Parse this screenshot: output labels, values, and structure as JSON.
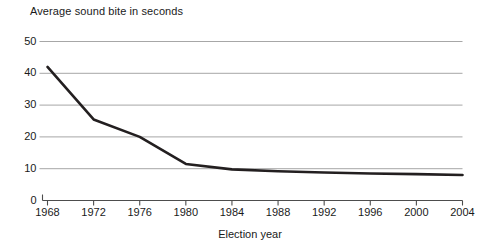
{
  "chart_data": {
    "type": "line",
    "title": "Average sound bite in seconds",
    "xlabel": "Election year",
    "ylabel": "",
    "x": [
      1968,
      1972,
      1976,
      1980,
      1984,
      1988,
      1992,
      1996,
      2000,
      2004
    ],
    "values": [
      42.0,
      25.5,
      20.0,
      11.5,
      9.8,
      9.2,
      8.8,
      8.5,
      8.3,
      8.0
    ],
    "series": [
      {
        "name": "Average sound bite in seconds",
        "values": [
          42.0,
          25.5,
          20.0,
          11.5,
          9.8,
          9.2,
          8.8,
          8.5,
          8.3,
          8.0
        ]
      }
    ],
    "xlim": [
      1968,
      2004
    ],
    "ylim": [
      0,
      50
    ],
    "y_ticks": [
      0,
      10,
      20,
      30,
      40,
      50
    ],
    "x_ticks": [
      1968,
      1972,
      1976,
      1980,
      1984,
      1988,
      1992,
      1996,
      2000,
      2004
    ],
    "y_tick_labels": [
      "0",
      "10",
      "20",
      "30",
      "40",
      "50"
    ],
    "x_tick_labels": [
      "1968",
      "1972",
      "1976",
      "1980",
      "1984",
      "1988",
      "1992",
      "1996",
      "2000",
      "2004"
    ],
    "grid": "horizontal",
    "legend": "none",
    "colors": {
      "line": "#231f20",
      "gridline": "#a7a7a7",
      "axis": "#4d4d4d",
      "text": "#1a1a1a",
      "background": "#ffffff"
    },
    "line_width": 2.6
  }
}
